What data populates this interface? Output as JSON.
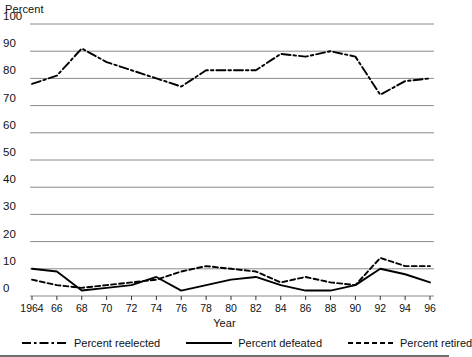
{
  "chart_data": {
    "type": "line",
    "title": "",
    "xlabel": "Year",
    "ylabel": "Percent",
    "ylim": [
      0,
      100
    ],
    "ytick_step": 10,
    "grid": true,
    "legend_position": "bottom",
    "y_ticks": [
      "100",
      "90",
      "80",
      "70",
      "60",
      "50",
      "40",
      "30",
      "20",
      "10",
      "0"
    ],
    "x_ticks": [
      "1964",
      "66",
      "68",
      "70",
      "72",
      "74",
      "76",
      "78",
      "80",
      "82",
      "84",
      "86",
      "88",
      "90",
      "92",
      "94",
      "96"
    ],
    "x": [
      1964,
      1966,
      1968,
      1970,
      1972,
      1974,
      1976,
      1978,
      1980,
      1982,
      1984,
      1986,
      1988,
      1990,
      1992,
      1994,
      1996
    ],
    "series": [
      {
        "name": "Percent reelected",
        "style": "dash-dot",
        "color": "#000000",
        "values": [
          78,
          81,
          91,
          86,
          83,
          80,
          77,
          83,
          83,
          83,
          89,
          88,
          90,
          88,
          74,
          79,
          80
        ]
      },
      {
        "name": "Percent defeated",
        "style": "solid",
        "color": "#000000",
        "values": [
          10,
          9,
          2,
          3,
          4,
          7,
          2,
          4,
          6,
          7,
          4,
          2,
          2,
          4,
          10,
          8,
          5
        ]
      },
      {
        "name": "Percent retired",
        "style": "dashed",
        "color": "#000000",
        "values": [
          6,
          4,
          3,
          4,
          5,
          6,
          9,
          11,
          10,
          9,
          5,
          7,
          5,
          4,
          14,
          11,
          11
        ]
      }
    ]
  },
  "legend": {
    "items": [
      {
        "label": "Percent reelected",
        "style": "dash-dot"
      },
      {
        "label": "Percent defeated",
        "style": "solid"
      },
      {
        "label": "Percent retired",
        "style": "dashed"
      }
    ]
  }
}
